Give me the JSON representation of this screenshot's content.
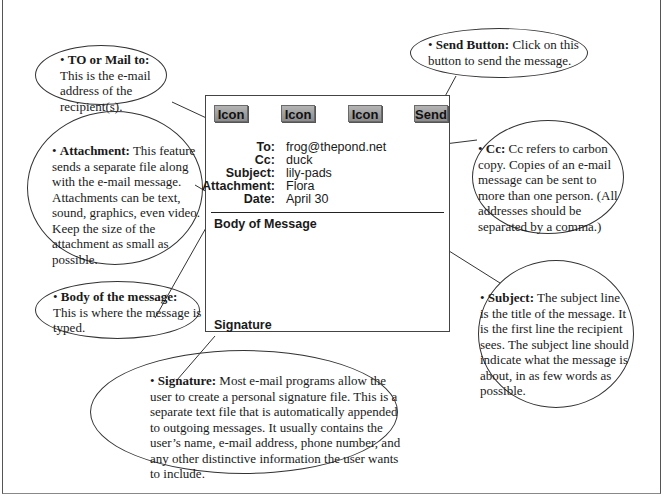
{
  "diagram": {
    "email_window": {
      "toolbar": {
        "buttons": [
          {
            "label": "Icon"
          },
          {
            "label": "Icon"
          },
          {
            "label": "Icon"
          },
          {
            "label": "Send"
          }
        ]
      },
      "fields": [
        {
          "label": "To:",
          "value": "frog@thepond.net"
        },
        {
          "label": "Cc:",
          "value": "duck"
        },
        {
          "label": "Subject:",
          "value": "lily-pads"
        },
        {
          "label": "Attachment:",
          "value": "Flora"
        },
        {
          "label": "Date:",
          "value": "April 30"
        }
      ],
      "body_label": "Body of Message",
      "signature_label": "Signature"
    },
    "callouts": {
      "to": {
        "bullet": "•",
        "title": "TO or Mail to:",
        "text": "This is the e-mail address of the recipient(s)."
      },
      "send": {
        "bullet": "•",
        "title": "Send Button:",
        "text": "Click on this button to send the message."
      },
      "attachment": {
        "bullet": "•",
        "title": "Attachment:",
        "text": "This feature sends a separate file along with the e-mail message. Attachments can be text, sound, graphics, even video. Keep the size of the attachment as small as possible."
      },
      "cc": {
        "bullet": "•",
        "title": "Cc:",
        "text": "Cc refers to carbon copy. Copies of an e-mail message can be sent to more than one person. (All addresses should be separated by a comma.)"
      },
      "body": {
        "bullet": "•",
        "title": "Body of the message:",
        "text": "This is where the message is typed."
      },
      "subject": {
        "bullet": "•",
        "title": "Subject:",
        "text": "The subject line is the title of the message. It is the first line the recipient sees. The subject line should indicate what the message is about, in as few words as possible."
      },
      "signature": {
        "bullet": "•",
        "title": "Signature:",
        "text": "Most e-mail programs allow the user to create a personal signature file. This is a separate text file that is automatically appended to outgoing messages. It usually contains the user’s name, e-mail address, phone number, and any other distinctive information the user wants to include."
      }
    },
    "colors": {
      "button_top": "#b4b4b4",
      "button_bottom": "#8c8c8c",
      "line": "#333333",
      "background": "#ffffff"
    }
  }
}
